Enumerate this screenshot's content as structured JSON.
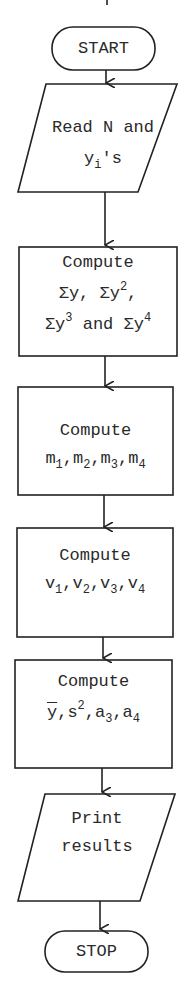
{
  "flowchart": {
    "nodes": [
      {
        "id": "start",
        "shape": "terminator",
        "lines": [
          "START"
        ]
      },
      {
        "id": "read",
        "shape": "parallelogram",
        "lines": [
          "Read N and",
          "y_i's"
        ],
        "line1": "Read N and",
        "line2_base": "y",
        "line2_sub": "i",
        "line2_rest": "'s"
      },
      {
        "id": "compute_sums",
        "shape": "rectangle",
        "title": "Compute",
        "terms": [
          "Σy",
          "Σy²",
          "Σy³",
          "Σy⁴"
        ],
        "joiner": "and"
      },
      {
        "id": "compute_m",
        "shape": "rectangle",
        "title": "Compute",
        "base": "m",
        "subs": [
          "1",
          "2",
          "3",
          "4"
        ]
      },
      {
        "id": "compute_v",
        "shape": "rectangle",
        "title": "Compute",
        "base": "v",
        "subs": [
          "1",
          "2",
          "3",
          "4"
        ]
      },
      {
        "id": "compute_stats",
        "shape": "rectangle",
        "title": "Compute",
        "terms": [
          "ȳ",
          "s²",
          "a₃",
          "a₄"
        ]
      },
      {
        "id": "print",
        "shape": "parallelogram",
        "lines": [
          "Print",
          "results"
        ]
      },
      {
        "id": "stop",
        "shape": "terminator",
        "lines": [
          "STOP"
        ]
      }
    ],
    "text": {
      "start": "START",
      "read_l1": "Read N and",
      "y": "y",
      "i": "i",
      "apos_s": "'s",
      "compute": "Compute",
      "sigma_y": "Σy",
      "comma": ",",
      "and": " and ",
      "two": "2",
      "three": "3",
      "four": "4",
      "one": "1",
      "m": "m",
      "v": "v",
      "s": "s",
      "a": "a",
      "print": "Print",
      "results": "results",
      "stop": "STOP"
    },
    "colors": {
      "stroke": "#222222",
      "text": "#2a2a2a",
      "background": "#ffffff"
    }
  }
}
